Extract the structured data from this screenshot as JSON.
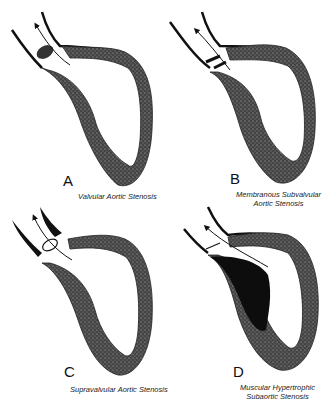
{
  "figure": {
    "panels": [
      {
        "id": "A",
        "letter": "A",
        "caption_lines": [
          "Valvular Aortic Stenosis"
        ]
      },
      {
        "id": "B",
        "letter": "B",
        "caption_lines": [
          "Membranous Subvalvular",
          "Aortic Stenosis"
        ]
      },
      {
        "id": "C",
        "letter": "C",
        "caption_lines": [
          "Supravalvular Aortic Stenosis"
        ]
      },
      {
        "id": "D",
        "letter": "D",
        "caption_lines": [
          "Muscular Hypertrophic",
          "Subaortic Stenosis"
        ]
      }
    ],
    "colors": {
      "wall": "#3a3a3a",
      "wall_light": "#6a6a6a",
      "ink": "#111111",
      "background": "#ffffff"
    }
  }
}
